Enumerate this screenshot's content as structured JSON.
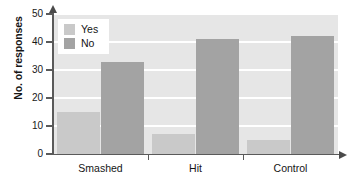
{
  "chart_data": {
    "type": "bar",
    "title": "",
    "xlabel": "",
    "ylabel": "No. of responses",
    "categories": [
      "Smashed",
      "Hit",
      "Control"
    ],
    "series": [
      {
        "name": "Yes",
        "color": "#c9c9c9",
        "values": [
          15,
          7,
          5
        ]
      },
      {
        "name": "No",
        "color": "#a3a3a3",
        "values": [
          33,
          41,
          42
        ]
      }
    ],
    "ylim": [
      0,
      50
    ],
    "ytick_labels": [
      "0",
      "10",
      "20",
      "30",
      "40",
      "50"
    ],
    "ytick_values": [
      0,
      10,
      20,
      30,
      40,
      50
    ],
    "grid": true,
    "legend_position": "top-left",
    "plot_background": "#e6e6e6",
    "gridline_color": "#ffffff",
    "axis_color": "#5a5a5a"
  },
  "legend": {
    "items": [
      {
        "label": "Yes"
      },
      {
        "label": "No"
      }
    ]
  },
  "axes": {
    "y_title": "No. of responses"
  }
}
